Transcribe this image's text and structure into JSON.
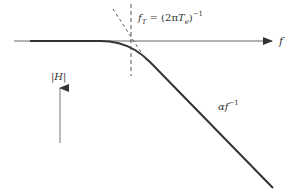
{
  "diagram": {
    "title": "",
    "axis_x_label": "f",
    "axis_y_label": "|H|",
    "corner_label_main": "f",
    "corner_label_sub": "T",
    "corner_label_eq": " = (2π",
    "corner_label_T": "T",
    "corner_label_Tsub": "e",
    "corner_label_close": ")",
    "corner_label_exp": "−1",
    "slope_label_main": "αf",
    "slope_label_exp": "−1",
    "colors": {
      "line": "#333333",
      "axis": "#555555",
      "dashed": "#555555",
      "background": "#ffffff"
    }
  }
}
